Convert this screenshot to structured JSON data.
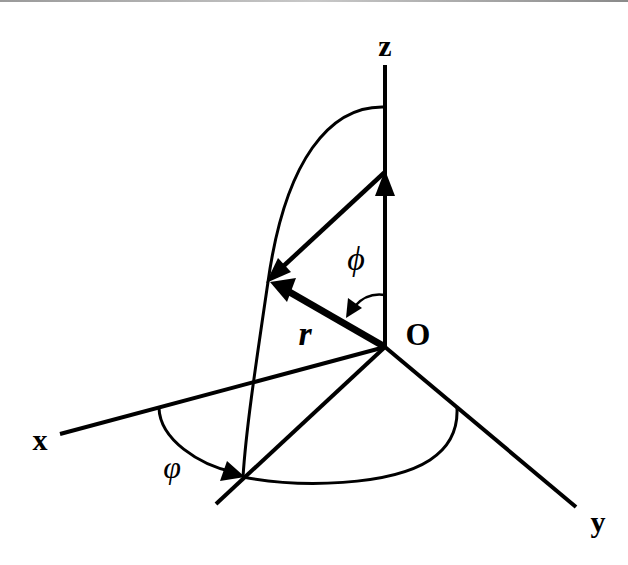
{
  "diagram": {
    "type": "spherical-coordinates",
    "labels": {
      "z_axis": "z",
      "x_axis": "x",
      "y_axis": "y",
      "origin": "O",
      "radius": "r",
      "polar_angle": "ϕ",
      "azimuth_angle": "φ"
    },
    "stroke_color": "#000000",
    "background": "#ffffff"
  }
}
